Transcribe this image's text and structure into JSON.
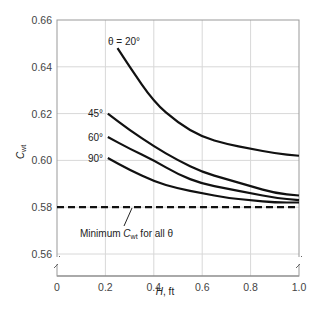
{
  "chart_data": {
    "type": "line",
    "title": "",
    "xlabel": "H, ft",
    "ylabel": "C_wt",
    "xlim": [
      0,
      1.0
    ],
    "ylim": [
      0.56,
      0.66
    ],
    "grid": true,
    "x_ticks": [
      "0",
      "0.2",
      "0.4",
      "0.6",
      "0.8",
      "1.0"
    ],
    "y_ticks": [
      "0.56",
      "0.58",
      "0.60",
      "0.62",
      "0.64",
      "0.66"
    ],
    "series": [
      {
        "name": "θ = 20°",
        "label": "θ = 20°",
        "x": [
          0.25,
          0.3,
          0.4,
          0.5,
          0.6,
          0.7,
          0.8,
          0.9,
          1.0
        ],
        "y": [
          0.648,
          0.64,
          0.625,
          0.616,
          0.61,
          0.607,
          0.605,
          0.603,
          0.602
        ]
      },
      {
        "name": "45°",
        "label": "45°",
        "x": [
          0.21,
          0.3,
          0.4,
          0.5,
          0.6,
          0.7,
          0.8,
          0.9,
          1.0
        ],
        "y": [
          0.62,
          0.613,
          0.606,
          0.6,
          0.595,
          0.592,
          0.589,
          0.586,
          0.585
        ]
      },
      {
        "name": "60°",
        "label": "60°",
        "x": [
          0.21,
          0.3,
          0.4,
          0.5,
          0.6,
          0.7,
          0.8,
          0.9,
          1.0
        ],
        "y": [
          0.61,
          0.605,
          0.6,
          0.594,
          0.59,
          0.588,
          0.586,
          0.584,
          0.583
        ]
      },
      {
        "name": "90°",
        "label": "90°",
        "x": [
          0.21,
          0.3,
          0.4,
          0.5,
          0.6,
          0.7,
          0.8,
          0.9,
          1.0
        ],
        "y": [
          0.601,
          0.596,
          0.591,
          0.588,
          0.586,
          0.584,
          0.583,
          0.582,
          0.582
        ]
      }
    ],
    "reference_line": {
      "y": 0.58,
      "style": "dashed",
      "label": "Minimum C_wt for all θ"
    },
    "annotation": {
      "text_prefix": "Minimum ",
      "symbol": "C",
      "subscript": "wt",
      "text_suffix": " for all θ"
    }
  },
  "axis": {
    "xlabel_italic": "H",
    "xlabel_unit": ", ft",
    "ylabel_symbol": "C",
    "ylabel_sub": "wt"
  }
}
